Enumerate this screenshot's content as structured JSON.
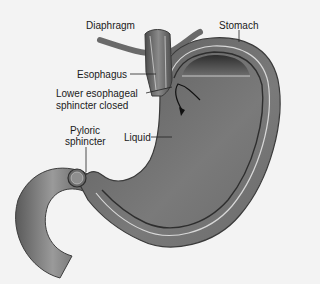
{
  "figure": {
    "style": "grayscale illustration",
    "colors": {
      "background": "#f3f3f3",
      "tissue_dark": "#4a4a4a",
      "tissue_mid": "#7a7a7a",
      "tissue_light": "#a8a8a8",
      "lining_line": "#d8d8d8",
      "label_text": "#1a1a1a"
    }
  },
  "labels": {
    "diaphragm": "Diaphragm",
    "stomach": "Stomach",
    "esophagus": "Esophagus",
    "les_line1": "Lower esophageal",
    "les_line2": "sphincter closed",
    "pyloric_line1": "Pyloric",
    "pyloric_line2": "sphincter",
    "liquid": "Liquid"
  },
  "annotations": {
    "arrow": "curved arrow indicating closed lower esophageal sphincter"
  }
}
